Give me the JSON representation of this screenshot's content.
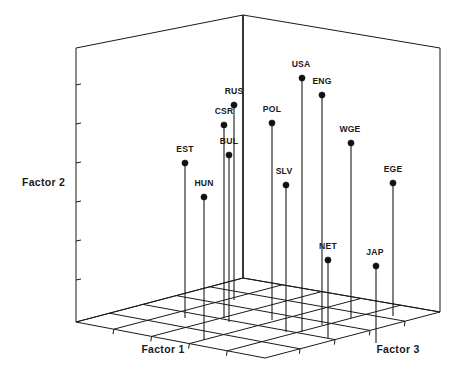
{
  "chart_data": {
    "type": "scatter",
    "projection": "3d",
    "title": "",
    "subtitle": "",
    "xlabel": "Factor 1",
    "ylabel": "Factor 2",
    "zlabel": "Factor 3",
    "axis_titles": {
      "x": "Factor 1",
      "y": "Factor 2",
      "z": "Factor 3"
    },
    "grid": true,
    "grid_divisions": 5,
    "legend": "none",
    "tick_labels": {
      "x": [],
      "y": [],
      "z": []
    },
    "y_axis_tick_count": 7,
    "point_labels": [
      "EST",
      "HUN",
      "CSR",
      "RUS",
      "BUL",
      "POL",
      "SLV",
      "USA",
      "ENG",
      "WGE",
      "EGE",
      "NET",
      "JAP"
    ],
    "points": [
      {
        "label": "EST",
        "px": 185,
        "py": 163,
        "base_y": 318,
        "label_x": 185,
        "label_y": 152,
        "x": 0.3,
        "y": 0.56,
        "z": 0.22
      },
      {
        "label": "HUN",
        "px": 204,
        "py": 197,
        "base_y": 340,
        "label_x": 204,
        "label_y": 186,
        "x": 0.34,
        "y": 0.48,
        "z": 0.1
      },
      {
        "label": "CSR",
        "px": 224,
        "py": 125,
        "base_y": 318,
        "label_x": 224,
        "label_y": 114,
        "x": 0.49,
        "y": 0.7,
        "z": 0.27
      },
      {
        "label": "RUS",
        "px": 234,
        "py": 105,
        "base_y": 300,
        "label_x": 234,
        "label_y": 94,
        "x": 0.52,
        "y": 0.74,
        "z": 0.36
      },
      {
        "label": "BUL",
        "px": 229,
        "py": 155,
        "base_y": 322,
        "label_x": 229,
        "label_y": 144,
        "x": 0.5,
        "y": 0.59,
        "z": 0.26
      },
      {
        "label": "POL",
        "px": 272,
        "py": 123,
        "base_y": 320,
        "label_x": 272,
        "label_y": 112,
        "x": 0.62,
        "y": 0.7,
        "z": 0.28
      },
      {
        "label": "SLV",
        "px": 286,
        "py": 185,
        "base_y": 332,
        "label_x": 284,
        "label_y": 174,
        "x": 0.67,
        "y": 0.52,
        "z": 0.18
      },
      {
        "label": "USA",
        "px": 302,
        "py": 78,
        "base_y": 332,
        "label_x": 301,
        "label_y": 67,
        "x": 0.72,
        "y": 0.84,
        "z": 0.18
      },
      {
        "label": "ENG",
        "px": 322,
        "py": 95,
        "base_y": 325,
        "label_x": 322,
        "label_y": 84,
        "x": 0.78,
        "y": 0.79,
        "z": 0.23
      },
      {
        "label": "WGE",
        "px": 351,
        "py": 143,
        "base_y": 318,
        "label_x": 350,
        "label_y": 132,
        "x": 0.86,
        "y": 0.65,
        "z": 0.3
      },
      {
        "label": "EGE",
        "px": 393,
        "py": 183,
        "base_y": 316,
        "label_x": 393,
        "label_y": 172,
        "x": 0.95,
        "y": 0.54,
        "z": 0.32
      },
      {
        "label": "NET",
        "px": 328,
        "py": 260,
        "base_y": 338,
        "label_x": 328,
        "label_y": 249,
        "x": 0.8,
        "y": 0.28,
        "z": 0.12
      },
      {
        "label": "JAP",
        "px": 376,
        "py": 266,
        "base_y": 343,
        "label_x": 375,
        "label_y": 255,
        "x": 0.9,
        "y": 0.26,
        "z": 0.08
      }
    ],
    "geometry": {
      "apex": [
        243,
        15
      ],
      "left_top": [
        76,
        48
      ],
      "right_top": [
        440,
        48
      ],
      "back_corner": [
        243,
        278
      ],
      "left_corner": [
        76,
        322
      ],
      "right_corner": [
        440,
        312
      ],
      "front_corner": [
        265,
        358
      ]
    },
    "colors": {
      "line": "#1a1a1a",
      "marker": "#111111",
      "background": "#ffffff",
      "text": "#1a1a1a"
    }
  },
  "axes": {
    "factor1": "Factor 1",
    "factor2": "Factor 2",
    "factor3": "Factor 3"
  }
}
